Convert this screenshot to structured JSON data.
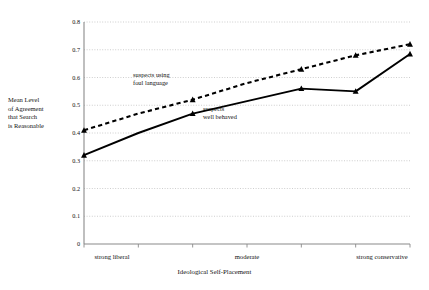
{
  "chart_data": {
    "type": "line",
    "title": "",
    "xlabel": "Ideological Self-Placement",
    "ylabel": "Mean Level of Agreement that Search is Reasonable",
    "ylim": [
      0,
      0.8
    ],
    "ytick_values": [
      0,
      0.1,
      0.2,
      0.3,
      0.4,
      0.5,
      0.6,
      0.7,
      0.8
    ],
    "ytick_labels": [
      "0",
      "0.1",
      "0.2",
      "0.3",
      "0.4",
      "0.5",
      "0.6",
      "0.7",
      "0.8"
    ],
    "grid": true,
    "legend_position": "inline-annotations",
    "x": [
      1,
      2,
      3,
      4,
      5,
      6,
      7
    ],
    "xtick_positions": [
      1,
      4,
      7
    ],
    "xtick_labels": [
      "strong  liberal",
      "moderate",
      "strong conservative"
    ],
    "series": [
      {
        "name": "suspects using foul language",
        "style": "dashed",
        "marker": "triangle",
        "values": [
          0.41,
          0.47,
          0.52,
          0.58,
          0.63,
          0.68,
          0.72
        ],
        "marker_at": [
          1,
          3,
          5,
          6,
          7
        ]
      },
      {
        "name": "suspects well behaved",
        "style": "solid",
        "marker": "triangle",
        "values": [
          0.32,
          0.4,
          0.47,
          0.515,
          0.56,
          0.55,
          0.685
        ],
        "marker_at": [
          1,
          3,
          5,
          6,
          7
        ]
      }
    ],
    "annotations": [
      {
        "id": "foul",
        "line1": "suspects using",
        "line2": "foul language"
      },
      {
        "id": "behaved",
        "line1": "suspects",
        "line2": "well behaved"
      }
    ]
  },
  "yaxis_caption": {
    "line1": "Mean Level",
    "line2": "of Agreement",
    "line3": "that Search",
    "line4": "is Reasonable"
  },
  "xaxis_caption": "Ideological Self-Placement",
  "ytick_labels": {
    "t0": "0",
    "t1": "0.1",
    "t2": "0.2",
    "t3": "0.3",
    "t4": "0.4",
    "t5": "0.5",
    "t6": "0.6",
    "t7": "0.7",
    "t8": "0.8"
  },
  "xtick_labels": {
    "left": "strong  liberal",
    "mid": "moderate",
    "right": "strong conservative"
  },
  "annotations": {
    "foul_l1": "suspects using",
    "foul_l2": "foul language",
    "behaved_l1": "suspects",
    "behaved_l2": "well behaved"
  },
  "colors": {
    "axis": "#8a8a8a",
    "grid": "#b9b9b9",
    "series": "#000000",
    "text": "#111111"
  }
}
